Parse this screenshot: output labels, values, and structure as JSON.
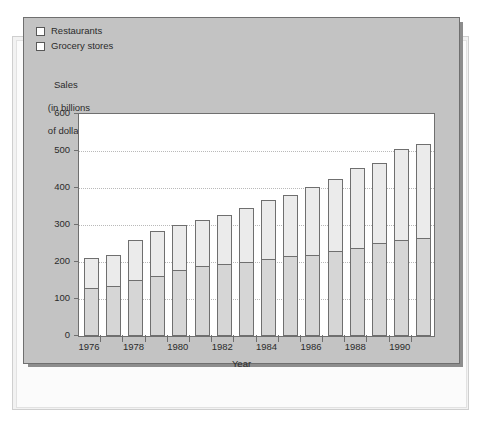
{
  "legend": {
    "items": [
      {
        "label": "Restaurants",
        "color": "#ebebeb"
      },
      {
        "label": "Grocery stores",
        "color": "#d6d6d6"
      }
    ]
  },
  "axis_caption": {
    "line1": "Sales",
    "line2": "(in billions",
    "line3": "of dollars)"
  },
  "chart_data": {
    "type": "bar",
    "subtype": "stacked",
    "title": "",
    "xlabel": "Year",
    "ylabel": "Sales (in billions of dollars)",
    "ylim": [
      0,
      600
    ],
    "yticks": [
      0,
      100,
      200,
      300,
      400,
      500,
      600
    ],
    "grid": "horizontal-dotted",
    "legend_position": "top-left",
    "categories": [
      "1976",
      "1977",
      "1978",
      "1979",
      "1980",
      "1981",
      "1982",
      "1983",
      "1984",
      "1985",
      "1986",
      "1987",
      "1988",
      "1989",
      "1990",
      "1991"
    ],
    "xtick_labels": [
      "1976",
      "1978",
      "1980",
      "1982",
      "1984",
      "1986",
      "1988",
      "1990"
    ],
    "series": [
      {
        "name": "Grocery stores",
        "color": "#d6d6d6",
        "values": [
          127,
          133,
          148,
          160,
          177,
          187,
          191,
          196,
          205,
          214,
          217,
          226,
          236,
          250,
          258,
          262
        ]
      },
      {
        "name": "Restaurants",
        "color": "#ebebeb",
        "values": [
          84,
          86,
          111,
          123,
          124,
          126,
          136,
          149,
          163,
          168,
          186,
          198,
          217,
          217,
          247,
          257
        ]
      }
    ],
    "totals": [
      211,
      219,
      259,
      283,
      301,
      313,
      327,
      345,
      368,
      382,
      403,
      424,
      453,
      467,
      505,
      519
    ]
  }
}
